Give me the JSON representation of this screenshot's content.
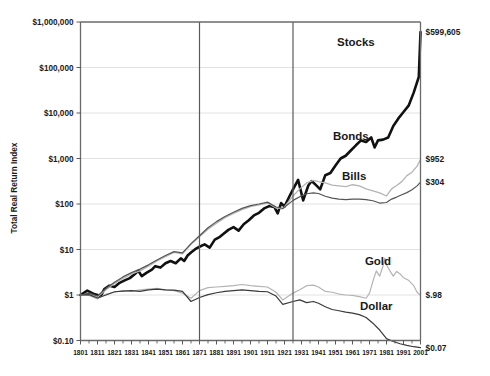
{
  "chart_data": {
    "type": "line",
    "title": "",
    "subtitle": "",
    "xlabel": "",
    "ylabel": "Total Real Return Index",
    "y_scale": "log",
    "ylim": [
      0.1,
      1000000
    ],
    "xlim": [
      1801,
      2001
    ],
    "grid": true,
    "legend_position": "inline-annotations",
    "y_ticks": [
      {
        "value": 1000000,
        "label": "$1,000,000"
      },
      {
        "value": 100000,
        "label": "$100,000"
      },
      {
        "value": 10000,
        "label": "$10,000"
      },
      {
        "value": 1000,
        "label": "$1,000"
      },
      {
        "value": 100,
        "label": "$100"
      },
      {
        "value": 10,
        "label": "$10"
      },
      {
        "value": 1,
        "label": "$1"
      },
      {
        "value": 0.1,
        "label": "$0.10"
      }
    ],
    "x_ticks": [
      "1801",
      "1811",
      "1821",
      "1831",
      "1841",
      "1851",
      "1861",
      "1871",
      "1881",
      "1891",
      "1901",
      "1911",
      "1921",
      "1931",
      "1941",
      "1951",
      "1961",
      "1971",
      "1981",
      "1991",
      "2001"
    ],
    "vertical_dividers": [
      1871,
      1926
    ],
    "series": [
      {
        "name": "Stocks",
        "color": "#111111",
        "width": 2.6,
        "end_value_label": "$599,605",
        "end_value": 599605,
        "label_x": 1963,
        "label_y": 300000,
        "x": [
          1801,
          1805,
          1809,
          1813,
          1815,
          1818,
          1821,
          1824,
          1827,
          1830,
          1833,
          1835,
          1837,
          1840,
          1843,
          1845,
          1848,
          1851,
          1854,
          1857,
          1860,
          1862,
          1864,
          1866,
          1869,
          1871,
          1874,
          1877,
          1880,
          1883,
          1885,
          1888,
          1891,
          1894,
          1897,
          1900,
          1903,
          1906,
          1909,
          1912,
          1915,
          1917,
          1919,
          1921,
          1924,
          1926,
          1929,
          1932,
          1935,
          1937,
          1940,
          1942,
          1945,
          1948,
          1951,
          1954,
          1957,
          1960,
          1963,
          1966,
          1969,
          1972,
          1974,
          1976,
          1979,
          1982,
          1985,
          1988,
          1991,
          1994,
          1997,
          2000,
          2001
        ],
        "y": [
          1,
          1.25,
          1.05,
          0.95,
          1.35,
          1.6,
          1.5,
          1.85,
          2.1,
          2.35,
          2.9,
          3.4,
          2.6,
          3.1,
          3.6,
          4.3,
          4.0,
          5.0,
          5.6,
          5.0,
          6.4,
          5.6,
          7.4,
          8.6,
          10.5,
          11.5,
          13.0,
          11.0,
          16.5,
          19.0,
          22.0,
          27.0,
          31.0,
          26.0,
          36.0,
          44.0,
          56.0,
          64.0,
          80.0,
          90.0,
          86.0,
          62.0,
          105.0,
          88.0,
          150.0,
          210.0,
          340.0,
          120.0,
          255.0,
          320.0,
          250.0,
          210.0,
          430.0,
          480.0,
          700.0,
          1000.0,
          1150.0,
          1500.0,
          1950.0,
          2500.0,
          2300.0,
          2900.0,
          1750.0,
          2500.0,
          2600.0,
          2900.0,
          5200.0,
          7600.0,
          10500.0,
          14500.0,
          28000.0,
          62000.0,
          599605.0
        ]
      },
      {
        "name": "Bonds",
        "color": "#b4b4b4",
        "width": 1.3,
        "end_value_label": "$952",
        "end_value": 952,
        "label_x": 1960,
        "label_y": 2600,
        "x": [
          1801,
          1806,
          1811,
          1816,
          1821,
          1826,
          1831,
          1836,
          1841,
          1846,
          1851,
          1856,
          1861,
          1866,
          1871,
          1876,
          1881,
          1886,
          1891,
          1896,
          1901,
          1906,
          1911,
          1916,
          1920,
          1926,
          1930,
          1934,
          1938,
          1941,
          1945,
          1949,
          1953,
          1957,
          1961,
          1965,
          1969,
          1973,
          1977,
          1981,
          1984,
          1987,
          1990,
          1993,
          1996,
          1999,
          2001
        ],
        "y": [
          1,
          1.05,
          0.9,
          1.3,
          1.8,
          2.3,
          2.9,
          3.4,
          4.3,
          5.6,
          7.0,
          8.6,
          8.0,
          13.0,
          19.0,
          28.0,
          38.0,
          50.0,
          62.0,
          75.0,
          88.0,
          96.0,
          105.0,
          82.0,
          78.0,
          150.0,
          215.0,
          290.0,
          330.0,
          310.0,
          290.0,
          260.0,
          250.0,
          240.0,
          265.0,
          250.0,
          215.0,
          195.0,
          175.0,
          150.0,
          215.0,
          255.0,
          310.0,
          420.0,
          500.0,
          680.0,
          952.0
        ]
      },
      {
        "name": "Bills",
        "color": "#555555",
        "width": 1.2,
        "end_value_label": "$304",
        "end_value": 304,
        "label_x": 1962,
        "label_y": 330,
        "x": [
          1801,
          1806,
          1811,
          1816,
          1821,
          1826,
          1831,
          1836,
          1841,
          1846,
          1851,
          1856,
          1861,
          1866,
          1871,
          1876,
          1881,
          1886,
          1891,
          1896,
          1901,
          1906,
          1911,
          1916,
          1920,
          1926,
          1930,
          1934,
          1938,
          1941,
          1945,
          1949,
          1953,
          1957,
          1961,
          1965,
          1969,
          1973,
          1977,
          1981,
          1984,
          1987,
          1990,
          1993,
          1996,
          1999,
          2001
        ],
        "y": [
          1,
          1.1,
          0.95,
          1.4,
          1.9,
          2.5,
          3.1,
          3.7,
          4.6,
          5.9,
          7.4,
          9.0,
          8.4,
          13.5,
          20.0,
          30.0,
          41.0,
          53.0,
          66.0,
          80.0,
          92.0,
          100.0,
          110.0,
          86.0,
          80.0,
          120.0,
          145.0,
          168.0,
          175.0,
          170.0,
          148.0,
          135.0,
          128.0,
          125.0,
          128.0,
          128.0,
          125.0,
          118.0,
          105.0,
          108.0,
          128.0,
          142.0,
          160.0,
          178.0,
          205.0,
          250.0,
          304.0
        ]
      },
      {
        "name": "Gold",
        "color": "#b4b4b4",
        "width": 1.2,
        "end_value_label": "$.98",
        "end_value": 0.98,
        "label_x": 1976,
        "label_y": 4.6,
        "x": [
          1801,
          1806,
          1811,
          1816,
          1821,
          1826,
          1831,
          1836,
          1841,
          1846,
          1851,
          1856,
          1861,
          1866,
          1871,
          1876,
          1881,
          1886,
          1891,
          1896,
          1901,
          1906,
          1911,
          1916,
          1920,
          1926,
          1930,
          1934,
          1938,
          1941,
          1945,
          1949,
          1953,
          1957,
          1961,
          1965,
          1969,
          1971,
          1973,
          1975,
          1977,
          1979,
          1980,
          1981,
          1983,
          1985,
          1987,
          1989,
          1991,
          1994,
          1997,
          1999,
          2001
        ],
        "y": [
          1,
          0.98,
          0.82,
          1.05,
          1.15,
          1.25,
          1.2,
          1.3,
          1.35,
          1.4,
          1.3,
          1.25,
          1.1,
          0.85,
          1.25,
          1.45,
          1.5,
          1.55,
          1.6,
          1.7,
          1.6,
          1.55,
          1.5,
          1.15,
          0.78,
          1.1,
          1.3,
          1.6,
          1.65,
          1.5,
          1.2,
          1.15,
          1.05,
          1.0,
          0.98,
          0.92,
          0.85,
          1.1,
          2.0,
          3.4,
          2.6,
          4.4,
          6.5,
          4.6,
          3.4,
          2.6,
          3.3,
          2.9,
          2.4,
          2.1,
          1.6,
          1.15,
          0.98
        ]
      },
      {
        "name": "Dollar",
        "color": "#3a3a3a",
        "width": 1.2,
        "end_value_label": "$0.07",
        "end_value": 0.07,
        "label_x": 1975,
        "label_y": 0.46,
        "x": [
          1801,
          1806,
          1811,
          1816,
          1821,
          1826,
          1831,
          1836,
          1841,
          1846,
          1851,
          1856,
          1861,
          1866,
          1871,
          1876,
          1881,
          1886,
          1891,
          1896,
          1901,
          1906,
          1911,
          1916,
          1920,
          1926,
          1930,
          1934,
          1938,
          1941,
          1945,
          1949,
          1953,
          1957,
          1961,
          1965,
          1969,
          1973,
          1977,
          1981,
          1985,
          1989,
          1993,
          1997,
          2001
        ],
        "y": [
          1,
          1.02,
          0.86,
          1.0,
          1.18,
          1.22,
          1.25,
          1.2,
          1.3,
          1.35,
          1.3,
          1.28,
          1.2,
          0.72,
          0.88,
          1.02,
          1.12,
          1.2,
          1.25,
          1.3,
          1.25,
          1.2,
          1.18,
          0.95,
          0.62,
          0.72,
          0.78,
          0.68,
          0.72,
          0.66,
          0.55,
          0.48,
          0.45,
          0.42,
          0.4,
          0.37,
          0.32,
          0.24,
          0.17,
          0.11,
          0.095,
          0.085,
          0.078,
          0.073,
          0.07
        ]
      }
    ]
  },
  "axis": {
    "y_title": "Total Real Return Index"
  },
  "end_labels": [
    {
      "name": "stocks-end-label",
      "text": "$599,605",
      "value": 599605
    },
    {
      "name": "bonds-end-label",
      "text": "$952",
      "value": 952
    },
    {
      "name": "bills-end-label",
      "text": "$304",
      "value": 304
    },
    {
      "name": "gold-end-label",
      "text": "$.98",
      "value": 0.98
    },
    {
      "name": "dollar-end-label",
      "text": "$0.07",
      "value": 0.07
    }
  ]
}
